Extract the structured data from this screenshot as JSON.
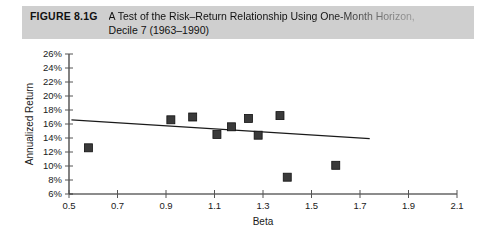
{
  "caption": {
    "figure_number": "FIGURE 8.1G",
    "line1": "A Test of the Risk–Return Relationship Using One-Month Horizon,",
    "line2": "Decile 7 (1963–1990)"
  },
  "chart_data": {
    "type": "scatter",
    "title": "A Test of the Risk–Return Relationship Using One-Month Horizon, Decile 7 (1963–1990)",
    "xlabel": "Beta",
    "ylabel": "Annualized Return",
    "xlim": [
      0.5,
      2.1
    ],
    "ylim": [
      6,
      26
    ],
    "grid": false,
    "legend": "none",
    "x_tick_labels": [
      "0.5",
      "0.7",
      "0.9",
      "1.1",
      "1.3",
      "1.5",
      "1.7",
      "1.9",
      "2.1"
    ],
    "x_ticks": [
      0.5,
      0.7,
      0.9,
      1.1,
      1.3,
      1.5,
      1.7,
      1.9,
      2.1
    ],
    "y_tick_labels": [
      "6%",
      "8%",
      "10%",
      "12%",
      "14%",
      "16%",
      "18%",
      "20%",
      "22%",
      "24%",
      "26%"
    ],
    "y_ticks": [
      6,
      8,
      10,
      12,
      14,
      16,
      18,
      20,
      22,
      24,
      26
    ],
    "points": [
      {
        "x": 0.58,
        "y": 12.6
      },
      {
        "x": 0.92,
        "y": 16.6
      },
      {
        "x": 1.01,
        "y": 17.0
      },
      {
        "x": 1.11,
        "y": 14.5
      },
      {
        "x": 1.17,
        "y": 15.6
      },
      {
        "x": 1.24,
        "y": 16.8
      },
      {
        "x": 1.28,
        "y": 14.4
      },
      {
        "x": 1.37,
        "y": 17.2
      },
      {
        "x": 1.4,
        "y": 8.4
      },
      {
        "x": 1.6,
        "y": 10.1
      }
    ],
    "trend_line": {
      "x_start": 0.51,
      "y_start": 16.6,
      "x_end": 1.74,
      "y_end": 13.9
    }
  }
}
